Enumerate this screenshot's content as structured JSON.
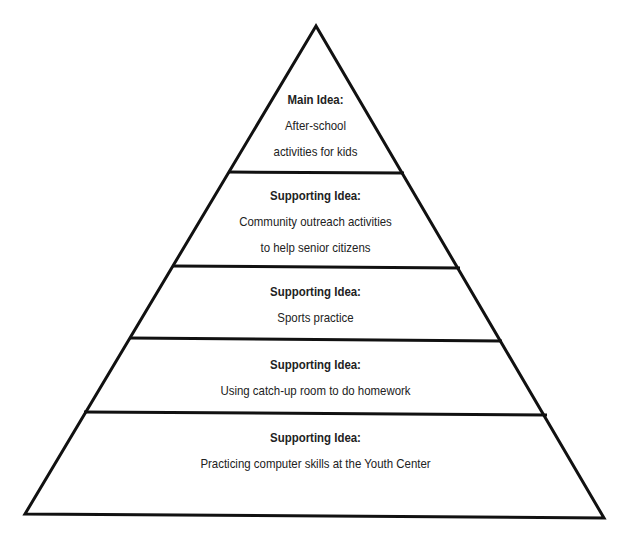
{
  "diagram": {
    "type": "pyramid",
    "stroke_color": "#111111",
    "layers": [
      {
        "heading": "Main Idea:",
        "lines": [
          "After-school",
          "activities for kids"
        ]
      },
      {
        "heading": "Supporting Idea:",
        "lines": [
          "Community outreach activities",
          "to help senior citizens"
        ]
      },
      {
        "heading": "Supporting Idea:",
        "lines": [
          "Sports practice"
        ]
      },
      {
        "heading": "Supporting Idea:",
        "lines": [
          "Using catch-up room to do homework"
        ]
      },
      {
        "heading": "Supporting Idea:",
        "lines": [
          "Practicing computer skills at the Youth Center"
        ]
      }
    ]
  }
}
